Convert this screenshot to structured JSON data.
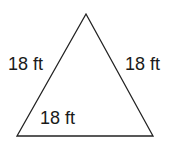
{
  "diagram": {
    "shape": "equilateral triangle",
    "vertices": [
      [
        86,
        14
      ],
      [
        17,
        136
      ],
      [
        153,
        136
      ]
    ],
    "stroke_color": "#222222",
    "labels": {
      "left_side": "18 ft",
      "right_side": "18 ft",
      "bottom_side": "18 ft"
    }
  }
}
